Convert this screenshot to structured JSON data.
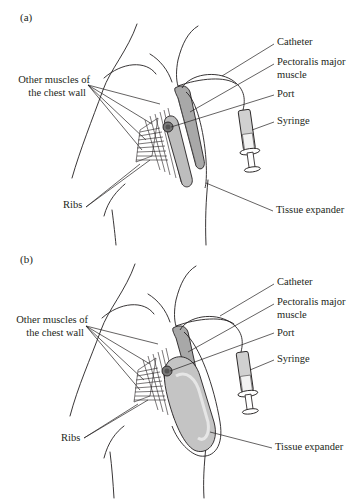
{
  "figure": {
    "panels": [
      {
        "id": "a",
        "label": "(a)",
        "expander_state": "deflated",
        "labels": {
          "catheter": "Catheter",
          "pectoralis_line1": "Pectoralis major",
          "pectoralis_line2": "muscle",
          "port": "Port",
          "syringe": "Syringe",
          "tissue_expander": "Tissue expander",
          "other_muscles_line1": "Other muscles of",
          "other_muscles_line2": "the chest wall",
          "ribs": "Ribs"
        }
      },
      {
        "id": "b",
        "label": "(b)",
        "expander_state": "inflated",
        "labels": {
          "catheter": "Catheter",
          "pectoralis_line1": "Pectoralis major",
          "pectoralis_line2": "muscle",
          "port": "Port",
          "syringe": "Syringe",
          "tissue_expander": "Tissue expander",
          "other_muscles_line1": "Other muscles of",
          "other_muscles_line2": "the chest wall",
          "ribs": "Ribs"
        }
      }
    ],
    "colors": {
      "line": "#231f20",
      "expander_fill": "#b8b8b8",
      "expander_fill_light": "#d9d9d9",
      "muscle_fill": "#9a9a9a",
      "background": "#ffffff"
    }
  }
}
